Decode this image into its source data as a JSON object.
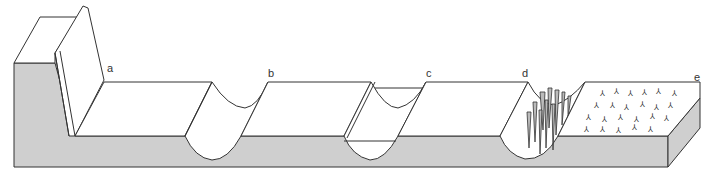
{
  "figure": {
    "colors": {
      "side_face": "#cfcfcf",
      "top_face": "#ffffff",
      "line": "#333333"
    }
  },
  "labels": [
    {
      "id": "a",
      "text": "a",
      "x": 107,
      "y": 71
    },
    {
      "id": "b",
      "text": "b",
      "x": 268,
      "y": 68
    },
    {
      "id": "c",
      "text": "c",
      "x": 426,
      "y": 68
    },
    {
      "id": "d",
      "text": "d",
      "x": 522,
      "y": 68
    },
    {
      "id": "e",
      "text": "e",
      "x": 694,
      "y": 72
    }
  ],
  "stages": [
    {
      "id": "a",
      "feature": "raised wall / scarp with flat floor"
    },
    {
      "id": "b",
      "feature": "U-shaped channel"
    },
    {
      "id": "c",
      "feature": "U-shaped channel with inner lining / terrace"
    },
    {
      "id": "d",
      "feature": "channel filled with spiky vertical structures"
    },
    {
      "id": "e",
      "feature": "flat block with scattered tripod marks"
    }
  ]
}
